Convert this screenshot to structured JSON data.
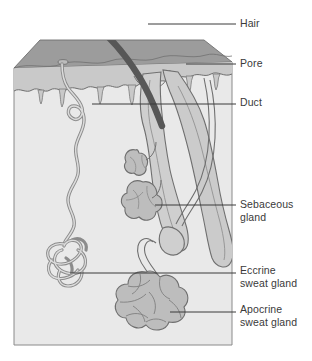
{
  "figure": {
    "type": "anatomical-diagram",
    "background_color": "#ffffff"
  },
  "colors": {
    "hair_shaft": "#555555",
    "top_surface": "#9a9a9a",
    "epidermis": "#c6c6c6",
    "dermis": "#e6e6e6",
    "gland_fill": "#bdbdbd",
    "duct_fill": "#d2d2d2",
    "outline": "#6f6f6f",
    "leader_line": "#3a3a3a",
    "label_text": "#3a3a3a"
  },
  "labels": {
    "hair": "Hair",
    "pore": "Pore",
    "duct": "Duct",
    "sebaceous": "Sebaceous\ngland",
    "eccrine": "Eccrine\nsweat gland",
    "apocrine": "Apocrine\nsweat gland"
  },
  "leader_lines": [
    {
      "name": "hair",
      "x1": 148,
      "y1": 24,
      "x2": 236,
      "y2": 24
    },
    {
      "name": "pore",
      "x1": 186,
      "y1": 64,
      "x2": 236,
      "y2": 64
    },
    {
      "name": "duct",
      "x1": 92,
      "y1": 104,
      "x2": 236,
      "y2": 104
    },
    {
      "name": "sebaceous",
      "x1": 155,
      "y1": 205,
      "x2": 236,
      "y2": 205
    },
    {
      "name": "eccrine",
      "x1": 70,
      "y1": 273,
      "x2": 236,
      "y2": 273
    },
    {
      "name": "apocrine",
      "x1": 170,
      "y1": 312,
      "x2": 236,
      "y2": 312
    }
  ],
  "structures": [
    {
      "name": "hair-shaft",
      "description": "thick dark curved strand emerging from skin surface"
    },
    {
      "name": "skin-block",
      "description": "3D block of skin shown in cut-away perspective"
    },
    {
      "name": "epidermis-layer",
      "description": "upper darker band with wavy lower boundary"
    },
    {
      "name": "dermis-layer",
      "description": "large light region filling the block body"
    },
    {
      "name": "hair-follicle",
      "description": "tube surrounding hair root ending in bulb"
    },
    {
      "name": "sebaceous-gland",
      "description": "lobular gland attached to follicle"
    },
    {
      "name": "eccrine-duct",
      "description": "wavy spiral tube from surface pore to coiled gland"
    },
    {
      "name": "eccrine-gland",
      "description": "tightly coiled tubular gland in deep dermis"
    },
    {
      "name": "apocrine-duct",
      "description": "tube from follicle down to lobular gland"
    },
    {
      "name": "apocrine-gland",
      "description": "large lobular gland at base of dermis"
    },
    {
      "name": "pore-opening",
      "description": "opening of duct at the skin surface"
    }
  ]
}
